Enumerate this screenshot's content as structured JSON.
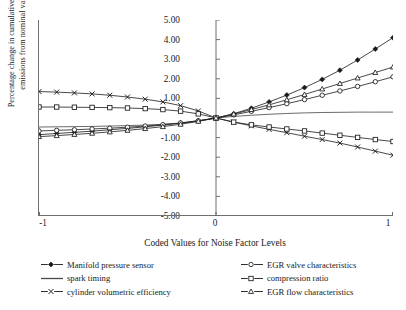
{
  "chart_data": {
    "type": "line",
    "title": "",
    "xlabel": "Coded Values for Noise Factor Levels",
    "ylabel": "Percentage change in cumulative HC feedgas\nemissions from nominal value [%]",
    "xlim": [
      -1,
      1
    ],
    "ylim": [
      -5.0,
      5.0
    ],
    "grid": false,
    "legend_position": "bottom",
    "xticks": [
      "-1",
      "0",
      "1"
    ],
    "xtick_values": [
      -1,
      0,
      1
    ],
    "yticks": [
      "5.00",
      "4.00",
      "3.00",
      "2.00",
      "1.00",
      "-1.00",
      "-2.00",
      "-3.00",
      "-4.00",
      "-5.00"
    ],
    "ytick_values": [
      5,
      4,
      3,
      2,
      1,
      -1,
      -2,
      -3,
      -4,
      -5
    ],
    "x": [
      -1.0,
      -0.9,
      -0.8,
      -0.7,
      -0.6,
      -0.5,
      -0.4,
      -0.3,
      -0.2,
      -0.1,
      0.0,
      0.1,
      0.2,
      0.3,
      0.4,
      0.5,
      0.6,
      0.7,
      0.8,
      0.9,
      1.0
    ],
    "series": [
      {
        "name": "Manifold pressure sensor",
        "marker": "filled-diamond",
        "color": "#1a1a1a",
        "values": [
          -0.85,
          -0.79,
          -0.73,
          -0.67,
          -0.6,
          -0.53,
          -0.45,
          -0.36,
          -0.26,
          -0.14,
          0.0,
          0.22,
          0.5,
          0.82,
          1.17,
          1.55,
          1.97,
          2.44,
          2.96,
          3.52,
          4.1
        ]
      },
      {
        "name": "spark timing",
        "marker": "none",
        "color": "#5a5a5a",
        "values": [
          -0.46,
          -0.45,
          -0.44,
          -0.43,
          -0.41,
          -0.39,
          -0.36,
          -0.32,
          -0.27,
          -0.16,
          0.0,
          0.08,
          0.14,
          0.19,
          0.23,
          0.26,
          0.28,
          0.29,
          0.3,
          0.3,
          0.3
        ]
      },
      {
        "name": "cylinder volumetric efficiency",
        "marker": "x",
        "color": "#1a1a1a",
        "values": [
          1.35,
          1.32,
          1.28,
          1.23,
          1.16,
          1.07,
          0.96,
          0.82,
          0.63,
          0.36,
          0.0,
          -0.21,
          -0.4,
          -0.58,
          -0.75,
          -0.93,
          -1.1,
          -1.28,
          -1.48,
          -1.69,
          -1.9
        ]
      },
      {
        "name": "EGR valve characteristics",
        "marker": "open-circle",
        "color": "#1a1a1a",
        "values": [
          -0.66,
          -0.63,
          -0.6,
          -0.56,
          -0.52,
          -0.47,
          -0.41,
          -0.34,
          -0.25,
          -0.14,
          0.0,
          0.16,
          0.34,
          0.53,
          0.73,
          0.94,
          1.16,
          1.38,
          1.61,
          1.85,
          2.1
        ]
      },
      {
        "name": "compression ratio",
        "marker": "open-square",
        "color": "#1a1a1a",
        "values": [
          0.56,
          0.56,
          0.55,
          0.54,
          0.53,
          0.51,
          0.48,
          0.43,
          0.35,
          0.21,
          0.0,
          -0.21,
          -0.35,
          -0.46,
          -0.56,
          -0.66,
          -0.77,
          -0.88,
          -0.99,
          -1.1,
          -1.2
        ]
      },
      {
        "name": "EGR flow characteristics",
        "marker": "open-triangle",
        "color": "#1a1a1a",
        "values": [
          -0.95,
          -0.9,
          -0.84,
          -0.78,
          -0.71,
          -0.63,
          -0.54,
          -0.44,
          -0.32,
          -0.17,
          0.0,
          0.2,
          0.43,
          0.67,
          0.93,
          1.2,
          1.48,
          1.76,
          2.04,
          2.32,
          2.6
        ]
      }
    ]
  },
  "legend": {
    "left_column": [
      {
        "label": "Manifold pressure sensor",
        "marker": "filled-diamond"
      },
      {
        "label": "spark timing",
        "marker": "none"
      },
      {
        "label": "cylinder volumetric efficiency",
        "marker": "x"
      }
    ],
    "right_column": [
      {
        "label": "EGR valve characteristics",
        "marker": "open-circle"
      },
      {
        "label": "compression ratio",
        "marker": "open-square"
      },
      {
        "label": "EGR flow characteristics",
        "marker": "open-triangle"
      }
    ]
  }
}
